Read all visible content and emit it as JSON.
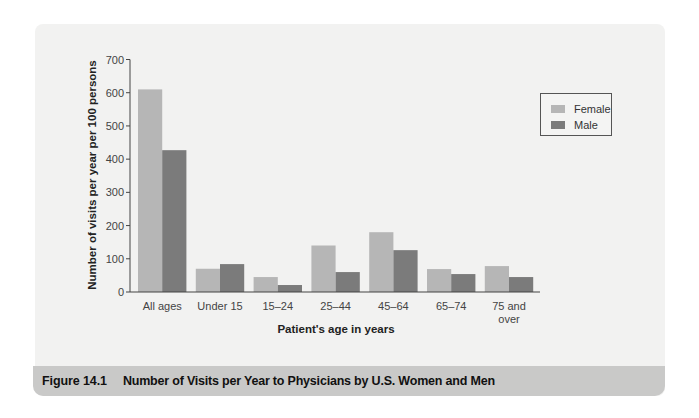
{
  "figure": {
    "label": "Figure 14.1",
    "title": "Number of Visits per Year to Physicians by U.S. Women and Men"
  },
  "colors": {
    "panel_bg": "#f2f2f1",
    "caption_bg": "#c9c9c8",
    "female": "#b6b6b6",
    "male": "#7b7b7b",
    "axis": "#444444"
  },
  "legend": {
    "items": [
      {
        "label": "Female",
        "color": "#b6b6b6"
      },
      {
        "label": "Male",
        "color": "#7b7b7b"
      }
    ]
  },
  "chart_data": {
    "type": "bar",
    "title": "Number of Visits per Year to Physicians by U.S. Women and Men",
    "xlabel": "Patient's age in years",
    "ylabel": "Number of visits per year per 100 persons",
    "ylim": [
      0,
      700
    ],
    "yticks": [
      0,
      100,
      200,
      300,
      400,
      500,
      600,
      700
    ],
    "grid": false,
    "legend_position": "upper right",
    "categories": [
      "All ages",
      "Under 15",
      "15–24",
      "25–44",
      "45–64",
      "65–74",
      "75 and over"
    ],
    "category_lines": [
      [
        "All ages"
      ],
      [
        "Under 15"
      ],
      [
        "15–24"
      ],
      [
        "25–44"
      ],
      [
        "45–64"
      ],
      [
        "65–74"
      ],
      [
        "75 and",
        "over"
      ]
    ],
    "series": [
      {
        "name": "Female",
        "values": [
          610,
          70,
          45,
          140,
          180,
          69,
          78
        ]
      },
      {
        "name": "Male",
        "values": [
          427,
          84,
          21,
          60,
          126,
          54,
          45
        ]
      }
    ]
  }
}
